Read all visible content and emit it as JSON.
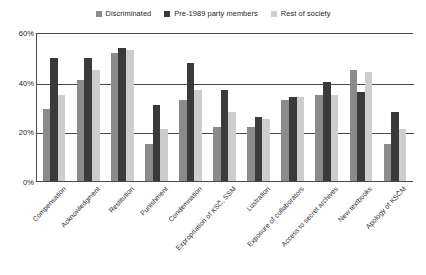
{
  "chart_data": {
    "type": "bar",
    "title": "",
    "xlabel": "",
    "ylabel": "",
    "ylim": [
      0,
      60
    ],
    "yticks": [
      "0%",
      "20%",
      "40%",
      "60%"
    ],
    "ytick_values": [
      0,
      20,
      40,
      60
    ],
    "grid": true,
    "legend_position": "top-center",
    "categories": [
      "Compensation",
      "Acknowledgment",
      "Restitution",
      "Punishment",
      "Condemnation",
      "Expropriation of KSČ, SSM",
      "Lustration",
      "Exposure of collaborators",
      "Access to secret archives",
      "New textbooks",
      "Apology of KSČM"
    ],
    "series": [
      {
        "name": "Discriminated",
        "color": "#8b8b8b",
        "values": [
          29,
          41,
          52,
          15,
          33,
          22,
          22,
          33,
          35,
          45,
          15
        ]
      },
      {
        "name": "Pre-1989 party members",
        "color": "#3a3a3a",
        "values": [
          50,
          50,
          54,
          31,
          48,
          37,
          26,
          34,
          40,
          36,
          28
        ]
      },
      {
        "name": "Rest of society",
        "color": "#cdcdcd",
        "values": [
          35,
          45,
          53,
          21,
          37,
          28,
          25,
          34,
          35,
          44,
          21
        ]
      }
    ]
  },
  "legend": {
    "items": [
      {
        "label": "Discriminated",
        "color": "#8b8b8b"
      },
      {
        "label": "Pre-1989 party members",
        "color": "#3a3a3a"
      },
      {
        "label": "Rest of society",
        "color": "#cdcdcd"
      }
    ]
  },
  "axis": {
    "y_ticks": [
      "60%",
      "40%",
      "20%",
      "0%"
    ]
  }
}
